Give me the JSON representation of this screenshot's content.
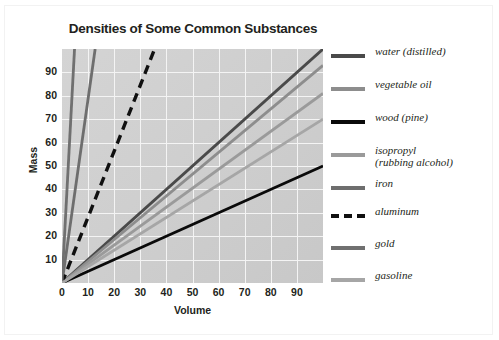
{
  "chart_data": {
    "type": "line",
    "title": "Densities of Some Common Substances",
    "xlabel": "Volume",
    "ylabel": "Mass",
    "xlim": [
      0,
      100
    ],
    "ylim": [
      0,
      100
    ],
    "xticks": [
      0,
      10,
      20,
      30,
      40,
      50,
      60,
      70,
      80,
      90
    ],
    "yticks": [
      10,
      20,
      30,
      40,
      50,
      60,
      70,
      80,
      90
    ],
    "grid": true,
    "legend_position": "right",
    "series": [
      {
        "name": "water (distilled)",
        "density": 1.0,
        "color": "#4a4a4a",
        "dash": false,
        "x": [
          0,
          100
        ],
        "y": [
          0,
          100
        ]
      },
      {
        "name": "vegetable oil",
        "density": 0.93,
        "color": "#8d8d8d",
        "dash": false,
        "x": [
          0,
          100
        ],
        "y": [
          0,
          93
        ]
      },
      {
        "name": "wood (pine)",
        "density": 0.5,
        "color": "#0a0a0a",
        "dash": false,
        "x": [
          0,
          100
        ],
        "y": [
          0,
          50
        ]
      },
      {
        "name": "isopropyl (rubbing alcohol)",
        "density": 0.81,
        "color": "#9a9a9a",
        "dash": false,
        "x": [
          0,
          100
        ],
        "y": [
          0,
          81
        ]
      },
      {
        "name": "iron",
        "density": 7.9,
        "color": "#6e6e6e",
        "dash": false,
        "x": [
          0,
          12.7
        ],
        "y": [
          0,
          100
        ]
      },
      {
        "name": "aluminum",
        "density": 2.7,
        "color": "#101010",
        "dash": true,
        "x": [
          0,
          35.5
        ],
        "y": [
          0,
          100
        ]
      },
      {
        "name": "gold",
        "density": 19.3,
        "color": "#707070",
        "dash": false,
        "x": [
          0,
          4.8
        ],
        "y": [
          0,
          100
        ]
      },
      {
        "name": "gasoline",
        "density": 0.7,
        "color": "#a6a6a6",
        "dash": false,
        "x": [
          0,
          100
        ],
        "y": [
          0,
          70
        ]
      }
    ]
  },
  "legend": {
    "items": [
      {
        "label": "water (distilled)"
      },
      {
        "label": "vegetable oil"
      },
      {
        "label": "wood (pine)"
      },
      {
        "label": "isopropyl\n(rubbing alcohol)"
      },
      {
        "label": "iron"
      },
      {
        "label": "aluminum"
      },
      {
        "label": "gold"
      },
      {
        "label": "gasoline"
      }
    ]
  }
}
